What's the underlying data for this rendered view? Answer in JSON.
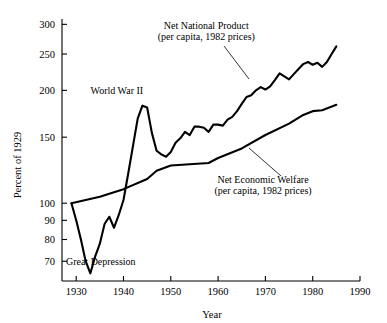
{
  "chart_data": {
    "type": "line",
    "title": "",
    "xlabel": "Year",
    "ylabel": "Percent of 1929",
    "xlim": [
      1927,
      1990
    ],
    "ylim": [
      62,
      310
    ],
    "yscale": "log",
    "grid": false,
    "legend_position": "inline-annotations",
    "xticks": [
      1930,
      1940,
      1950,
      1960,
      1970,
      1980,
      1990
    ],
    "xtick_labels": [
      "1930",
      "1940",
      "1950",
      "1960",
      "1970",
      "1980",
      "1990"
    ],
    "yticks": [
      70,
      80,
      90,
      100,
      150,
      200,
      250,
      300
    ],
    "ytick_labels": [
      "70",
      "80",
      "90",
      "100",
      "150",
      "200",
      "250",
      "300"
    ],
    "annotations": [
      {
        "id": "ww2",
        "text": "World War II",
        "x": 1938.6,
        "y": 196
      },
      {
        "id": "great-depression",
        "text": "Great Depression",
        "x": 1935.2,
        "y": 68.5
      },
      {
        "id": "nnp-label-line1",
        "text": "Net National Product",
        "x": 1957.5,
        "y": 292
      },
      {
        "id": "nnp-label-line2",
        "text": "(per capita, 1982 prices)",
        "x": 1957.5,
        "y": 272
      },
      {
        "id": "new-label-line1",
        "text": "Net Economic Welfare",
        "x": 1969.5,
        "y": 113
      },
      {
        "id": "new-label-line2",
        "text": "(per capita, 1982 prices)",
        "x": 1969.5,
        "y": 106
      }
    ],
    "series": [
      {
        "name": "Net National Product",
        "label_line2": "(per capita, 1982 prices)",
        "x": [
          1929,
          1930,
          1931,
          1932,
          1933,
          1934,
          1935,
          1936,
          1937,
          1938,
          1939,
          1940,
          1941,
          1942,
          1943,
          1944,
          1945,
          1946,
          1947,
          1948,
          1949,
          1950,
          1951,
          1952,
          1953,
          1954,
          1955,
          1956,
          1957,
          1958,
          1959,
          1960,
          1961,
          1962,
          1963,
          1964,
          1965,
          1966,
          1967,
          1968,
          1969,
          1970,
          1971,
          1972,
          1973,
          1974,
          1975,
          1976,
          1977,
          1978,
          1979,
          1980,
          1981,
          1982,
          1983,
          1984,
          1985
        ],
        "values": [
          100,
          90,
          80,
          70,
          65,
          72,
          78,
          88,
          92,
          86,
          93,
          102,
          120,
          142,
          168,
          182,
          180,
          154,
          138,
          135,
          133,
          137,
          145,
          149,
          155,
          152,
          160,
          160,
          159,
          155,
          162,
          162,
          161,
          167,
          170,
          176,
          184,
          192,
          194,
          200,
          204,
          201,
          205,
          213,
          222,
          218,
          214,
          221,
          228,
          235,
          238,
          234,
          237,
          231,
          238,
          250,
          262
        ]
      },
      {
        "name": "Net Economic Welfare",
        "label_line2": "(per capita, 1982 prices)",
        "x": [
          1929,
          1935,
          1940,
          1945,
          1947,
          1950,
          1954,
          1958,
          1960,
          1965,
          1970,
          1975,
          1978,
          1980,
          1982,
          1985
        ],
        "values": [
          100,
          104,
          109,
          116,
          122,
          126,
          127,
          128,
          132,
          140,
          152,
          163,
          172,
          176,
          177,
          183
        ]
      }
    ]
  }
}
